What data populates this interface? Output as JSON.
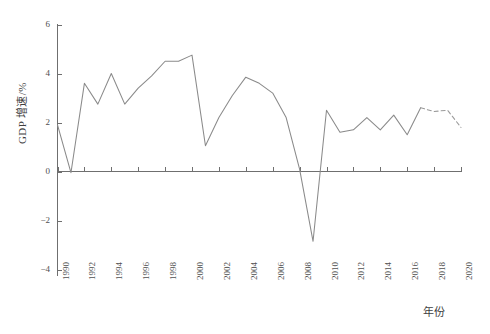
{
  "chart_data": {
    "type": "line",
    "title": "",
    "xlabel": "年份",
    "ylabel": "GDP 增速/%",
    "xlim": [
      1990,
      2020
    ],
    "ylim": [
      -4,
      6
    ],
    "yticks": [
      6,
      4,
      2,
      0,
      -2,
      -4
    ],
    "ytick_labels": [
      "6",
      "4",
      "2",
      "0",
      "-2",
      "-4"
    ],
    "xticks": [
      1990,
      1992,
      1994,
      1996,
      1998,
      2000,
      2002,
      2004,
      2006,
      2008,
      2010,
      2012,
      2014,
      2016,
      2018,
      2020
    ],
    "xtick_labels": [
      "1990",
      "1992",
      "1994",
      "1996",
      "1998",
      "2000",
      "2002",
      "2004",
      "2006",
      "2008",
      "2010",
      "2012",
      "2014",
      "2016",
      "2018",
      "2020"
    ],
    "grid": false,
    "legend": null,
    "x": [
      1990,
      1991,
      1992,
      1993,
      1994,
      1995,
      1996,
      1997,
      1998,
      1999,
      2000,
      2001,
      2002,
      2003,
      2004,
      2005,
      2006,
      2007,
      2008,
      2009,
      2010,
      2011,
      2012,
      2013,
      2014,
      2015,
      2016,
      2017,
      2018,
      2019,
      2020
    ],
    "series": [
      {
        "name": "GDP 增速",
        "style": "solid",
        "color": "#8a8a8a",
        "x": [
          1990,
          1991,
          1992,
          1993,
          1994,
          1995,
          1996,
          1997,
          1998,
          1999,
          2000,
          2001,
          2002,
          2003,
          2004,
          2005,
          2006,
          2007,
          2008,
          2009,
          2010,
          2011,
          2012,
          2013,
          2014,
          2015,
          2016,
          2017
        ],
        "values": [
          1.9,
          -0.05,
          3.6,
          2.75,
          4.0,
          2.75,
          3.4,
          3.9,
          4.5,
          4.5,
          4.75,
          1.05,
          2.2,
          3.1,
          3.85,
          3.6,
          3.2,
          2.2,
          0.1,
          -2.85,
          2.5,
          1.6,
          1.7,
          2.2,
          1.7,
          2.3,
          1.5,
          2.6
        ],
        "linestyle": "solid"
      },
      {
        "name": "GDP 增速 (预测)",
        "style": "dashed",
        "color": "#9a9a9a",
        "x": [
          2017,
          2018,
          2019,
          2020
        ],
        "values": [
          2.6,
          2.45,
          2.5,
          1.8
        ],
        "linestyle": "dashed"
      }
    ]
  },
  "axes": {
    "y_title": "GDP 增速/%",
    "x_title": "年份"
  }
}
